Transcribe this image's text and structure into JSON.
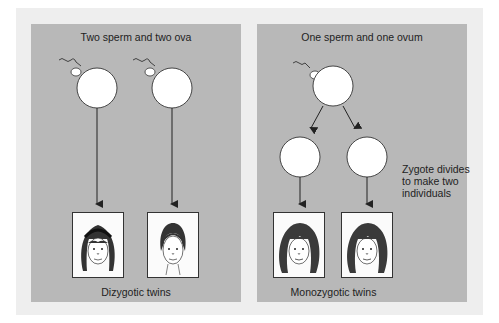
{
  "figure": {
    "left_panel": {
      "title": "Two sperm and two ova",
      "caption": "Dizygotic twins",
      "faces": [
        {
          "label": "twin-1",
          "hair": "bangs-long"
        },
        {
          "label": "twin-2",
          "hair": "short-pulled-back"
        }
      ]
    },
    "right_panel": {
      "title": "One sperm and one ovum",
      "side_note": "Zygote divides to make two individuals",
      "side_note_lines": [
        "Zygote divides",
        "to make two",
        "individuals"
      ],
      "caption": "Monozygotic twins",
      "faces": [
        {
          "label": "twin-1",
          "hair": "long-wavy"
        },
        {
          "label": "twin-2",
          "hair": "long-wavy"
        }
      ]
    },
    "colors": {
      "outer_background": "#eeeeee",
      "panel_background": "#b8b8b8",
      "cell_fill": "#ffffff",
      "line_color": "#333333"
    }
  }
}
